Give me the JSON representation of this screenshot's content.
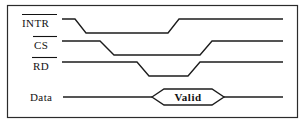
{
  "figure": {
    "kind": "digital-timing-diagram",
    "border_color": "#2b2b2b",
    "line_color": "#1c1c1c",
    "background_color": "#ffffff",
    "text_color": "#121212"
  },
  "signals": [
    {
      "name": "INTR",
      "label": "INTR",
      "active_low": true,
      "overline": true,
      "row": 1,
      "waveform": "high-low-high",
      "transitions": [
        {
          "type": "falling",
          "start_x": 75,
          "end_x": 86
        },
        {
          "type": "rising",
          "start_x": 168,
          "end_x": 179
        }
      ]
    },
    {
      "name": "CS",
      "label": "CS",
      "active_low": true,
      "overline": true,
      "row": 2,
      "waveform": "high-low-high",
      "transitions": [
        {
          "type": "falling",
          "start_x": 100,
          "end_x": 114
        },
        {
          "type": "rising",
          "start_x": 200,
          "end_x": 212
        }
      ]
    },
    {
      "name": "RD",
      "label": "RD",
      "active_low": true,
      "overline": true,
      "row": 3,
      "waveform": "high-low-high",
      "transitions": [
        {
          "type": "falling",
          "start_x": 137,
          "end_x": 149
        },
        {
          "type": "rising",
          "start_x": 188,
          "end_x": 200
        }
      ]
    },
    {
      "name": "Data",
      "label": "Data",
      "active_low": false,
      "overline": false,
      "row": 4,
      "waveform": "bus-valid-window",
      "bus_value": "Valid",
      "window": {
        "open_x": 152,
        "flat_start_x": 164,
        "flat_end_x": 212,
        "close_x": 224
      }
    }
  ],
  "bus": {
    "valid_label": "Valid"
  }
}
